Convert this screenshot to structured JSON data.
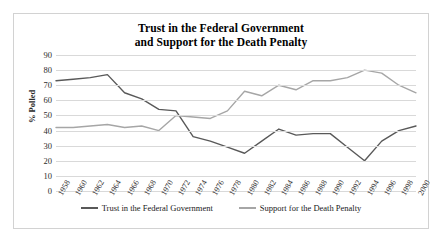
{
  "chart_data": {
    "type": "line",
    "title": "Trust in the Federal Government and Support for the Death Penalty",
    "title_line1": "Trust in the Federal Government",
    "title_line2": "and Support for the Death Penalty",
    "xlabel": "",
    "ylabel": "% Polled",
    "ylim": [
      0,
      90
    ],
    "yticks": [
      90,
      80,
      70,
      60,
      50,
      40,
      30,
      20,
      10,
      0
    ],
    "grid": true,
    "legend_position": "bottom",
    "categories": [
      "1958",
      "1960",
      "1962",
      "1964",
      "1966",
      "1968",
      "1970",
      "1972",
      "1974",
      "1976",
      "1978",
      "1980",
      "1982",
      "1984",
      "1986",
      "1988",
      "1990",
      "1992",
      "1994",
      "1996",
      "1998",
      "2000"
    ],
    "series": [
      {
        "name": "Trust in the Federal Government",
        "color": "#595959",
        "values": [
          73,
          74,
          75,
          77,
          65,
          61,
          54,
          53,
          36,
          33,
          29,
          25,
          33,
          41,
          37,
          38,
          38,
          29,
          20,
          33,
          40,
          43
        ]
      },
      {
        "name": "Support for the Death Penalty",
        "color": "#a6a6a6",
        "values": [
          42,
          42,
          43,
          44,
          42,
          43,
          40,
          50,
          49,
          48,
          53,
          66,
          63,
          70,
          67,
          73,
          73,
          75,
          80,
          78,
          70,
          65
        ]
      }
    ]
  },
  "legend": {
    "items": [
      {
        "label": "Trust in the Federal Government",
        "color": "#595959"
      },
      {
        "label": "Support for the Death Penalty",
        "color": "#a6a6a6"
      }
    ]
  }
}
